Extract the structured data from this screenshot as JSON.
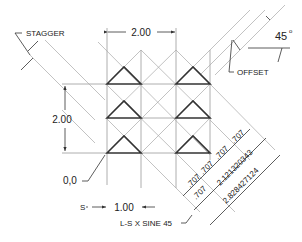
{
  "labels": {
    "stagger": "STAGGER",
    "offset": "OFFSET",
    "angle": "45",
    "angle_unit": "o",
    "width_dim": "2.00",
    "height_dim": "2.00",
    "origin": "0,0",
    "spacing_dim": "1.00",
    "s_label": "S",
    "formula": "L-S X SINE 45"
  },
  "diagonal_dims": {
    "segments_upper": [
      ".707",
      ".707",
      ".707",
      ".707"
    ],
    "segments_lower": [
      ".707",
      ".707"
    ],
    "mid_total": "2.121320343",
    "outer_total": "2.828427124"
  },
  "colors": {
    "thin_line": "#9a9a9a",
    "thick_line": "#333333",
    "text": "#222222"
  }
}
